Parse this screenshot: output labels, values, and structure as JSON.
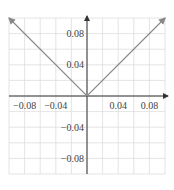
{
  "chart_data": {
    "type": "line",
    "title": "",
    "xlabel": "",
    "ylabel": "",
    "xlim": [
      -0.1,
      0.1
    ],
    "ylim": [
      -0.1,
      0.1
    ],
    "grid": true,
    "grid_step": 0.02,
    "x_ticks": [
      -0.08,
      -0.04,
      0.04,
      0.08
    ],
    "y_ticks": [
      0.08,
      0.04,
      -0.04,
      -0.08
    ],
    "x_tick_labels": [
      "−0.08",
      "−0.04",
      "0.04",
      "0.08"
    ],
    "y_tick_labels": [
      "0.08",
      "0.04",
      "−0.04",
      "−0.08"
    ],
    "series": [
      {
        "name": "y = |x|",
        "x": [
          -0.1,
          0.0,
          0.1
        ],
        "y": [
          0.1,
          0.0,
          0.1
        ],
        "color": "#888888",
        "arrows_at_ends": true
      }
    ],
    "legend": null,
    "axis_color": "#333333",
    "grid_color": "#dddddd"
  }
}
